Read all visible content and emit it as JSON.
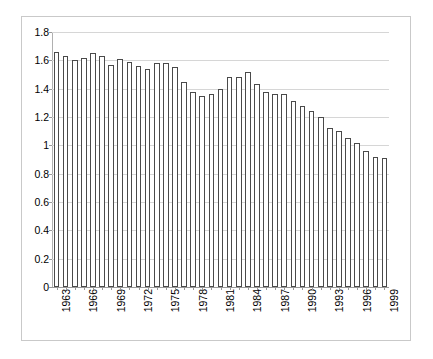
{
  "chart_data": {
    "type": "bar",
    "title": "",
    "subtitle": "",
    "xlabel": "",
    "ylabel": "",
    "ylim": [
      0,
      1.8
    ],
    "ytick_labels": [
      "0",
      "0.2",
      "0.4",
      "0.6",
      "0.8",
      "1",
      "1.2",
      "1.4",
      "1.6",
      "1.8"
    ],
    "ytick_values": [
      0,
      0.2,
      0.4,
      0.6,
      0.8,
      1,
      1.2,
      1.4,
      1.6,
      1.8
    ],
    "grid": true,
    "legend": null,
    "legend_position": "none",
    "xtick_label_interval": 3,
    "xtick_labels_shown": [
      "1963",
      "1966",
      "1969",
      "1972",
      "1975",
      "1978",
      "1981",
      "1984",
      "1987",
      "1990",
      "1993",
      "1996",
      "1999"
    ],
    "categories": [
      "1963",
      "1964",
      "1965",
      "1966",
      "1967",
      "1968",
      "1969",
      "1970",
      "1971",
      "1972",
      "1973",
      "1974",
      "1975",
      "1976",
      "1977",
      "1978",
      "1979",
      "1980",
      "1981",
      "1982",
      "1983",
      "1984",
      "1985",
      "1986",
      "1987",
      "1988",
      "1989",
      "1990",
      "1991",
      "1992",
      "1993",
      "1994",
      "1995",
      "1996",
      "1997",
      "1998",
      "1999"
    ],
    "values": [
      1.66,
      1.63,
      1.6,
      1.62,
      1.65,
      1.63,
      1.57,
      1.61,
      1.59,
      1.56,
      1.54,
      1.58,
      1.58,
      1.55,
      1.45,
      1.38,
      1.35,
      1.36,
      1.4,
      1.48,
      1.48,
      1.52,
      1.43,
      1.38,
      1.36,
      1.36,
      1.31,
      1.28,
      1.24,
      1.2,
      1.12,
      1.1,
      1.05,
      1.02,
      0.96,
      0.92,
      0.91
    ],
    "bar_fill_color": "#ffffff",
    "bar_edge_color": "#4a4a4a",
    "gridline_color": "#d6d6d6",
    "axis_color": "#9a9a9a",
    "frame_color": "#c9c9c9",
    "background_color": "#ffffff"
  }
}
